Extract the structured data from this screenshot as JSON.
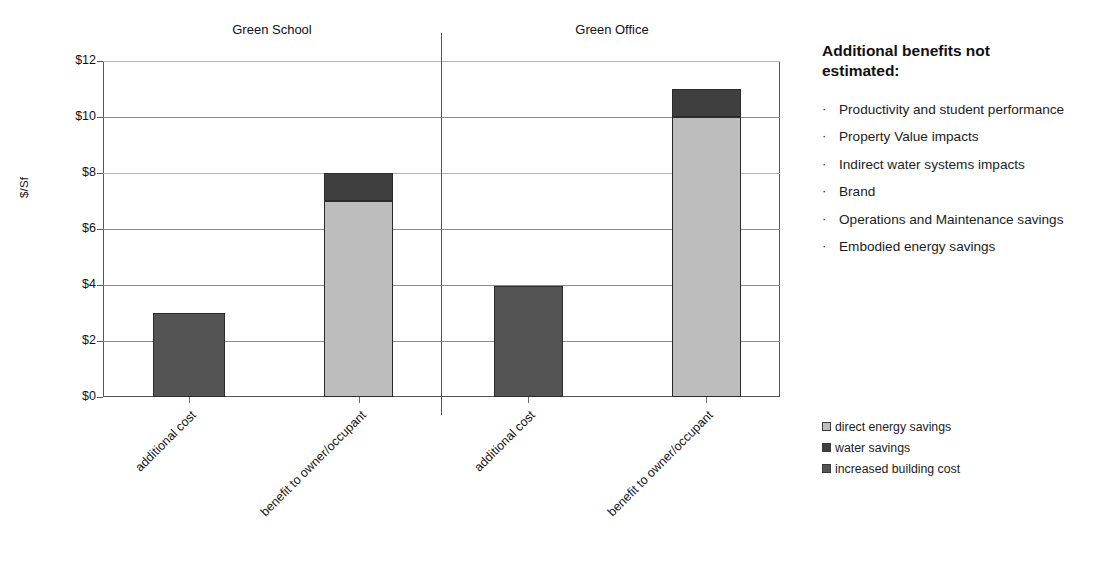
{
  "chart_data": {
    "type": "bar",
    "subtype": "stacked",
    "title": "",
    "xlabel": "",
    "ylabel": "$/Sf",
    "ylim": [
      0,
      12
    ],
    "ytick_labels": [
      "$0",
      "$2",
      "$4",
      "$6",
      "$8",
      "$10",
      "$12"
    ],
    "ytick_values": [
      0,
      2,
      4,
      6,
      8,
      10,
      12
    ],
    "grid": true,
    "legend_position": "right-bottom",
    "groups": [
      {
        "name": "Green School",
        "categories": [
          "additional cost",
          "benefit to owner/occupant"
        ]
      },
      {
        "name": "Green Office",
        "categories": [
          "additional cost",
          "benefit to owner/occupant"
        ]
      }
    ],
    "series": [
      {
        "name": "direct energy savings",
        "color": "#bdbdbd",
        "values": [
          0,
          7.0,
          0,
          10.0
        ]
      },
      {
        "name": "water savings",
        "color": "#3f3f3f",
        "values": [
          0,
          1.0,
          0,
          1.0
        ]
      },
      {
        "name": "increased building cost",
        "color": "#545454",
        "values": [
          3.0,
          0,
          3.95,
          0
        ]
      }
    ],
    "bars": [
      {
        "group": "Green School",
        "category": "additional cost",
        "total": 3.0,
        "segments": [
          {
            "series": "increased building cost",
            "value": 3.0,
            "from": 0,
            "to": 3.0
          }
        ]
      },
      {
        "group": "Green School",
        "category": "benefit to owner/occupant",
        "total": 8.0,
        "segments": [
          {
            "series": "direct energy savings",
            "value": 7.0,
            "from": 0,
            "to": 7.0
          },
          {
            "series": "water savings",
            "value": 1.0,
            "from": 7.0,
            "to": 8.0
          }
        ]
      },
      {
        "group": "Green Office",
        "category": "additional cost",
        "total": 3.95,
        "segments": [
          {
            "series": "increased building cost",
            "value": 3.95,
            "from": 0,
            "to": 3.95
          }
        ]
      },
      {
        "group": "Green Office",
        "category": "benefit to owner/occupant",
        "total": 11.0,
        "segments": [
          {
            "series": "direct energy savings",
            "value": 10.0,
            "from": 0,
            "to": 10.0
          },
          {
            "series": "water savings",
            "value": 1.0,
            "from": 10.0,
            "to": 11.0
          }
        ]
      }
    ],
    "legend": [
      {
        "label": "direct energy savings",
        "color": "#bdbdbd"
      },
      {
        "label": "water savings",
        "color": "#3f3f3f"
      },
      {
        "label": "increased building cost",
        "color": "#545454"
      }
    ]
  },
  "side_panel": {
    "heading": "Additional benefits not estimated:",
    "bullet_glyph": "·",
    "items": [
      "Productivity and student performance",
      "Property Value impacts",
      "Indirect water systems impacts",
      "Brand",
      "Operations and Maintenance savings",
      "Embodied energy savings"
    ]
  }
}
